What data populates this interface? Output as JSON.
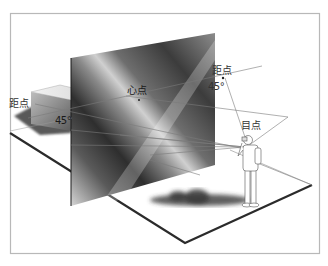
{
  "diagram": {
    "title": "",
    "labels": {
      "distance_point_left": "距点",
      "angle_left": "45°",
      "center_point": "心点",
      "distance_point_right": "距点",
      "angle_right": "45°",
      "eye_point": "目点"
    },
    "elements": [
      "frame",
      "ground-plane",
      "picture-plane",
      "box",
      "observer-figure",
      "observer-shadow",
      "sight-lines",
      "horizon-line"
    ],
    "colors": {
      "frame_border": "#b8b8b8",
      "ground_edge": "#2b2b2b",
      "picture_plane_dark": "#3a3a3a",
      "picture_plane_light": "#bdbdbd",
      "line": "#7a7a7a",
      "background": "#ffffff"
    }
  }
}
